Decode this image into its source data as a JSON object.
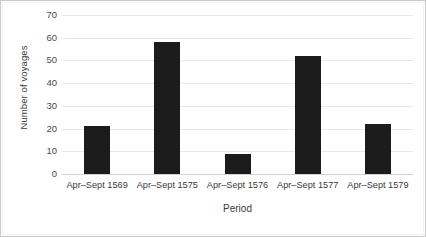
{
  "chart_data": {
    "type": "bar",
    "title": "",
    "xlabel": "Period",
    "ylabel": "Number of voyages",
    "categories": [
      "Apr–Sept 1569",
      "Apr–Sept 1575",
      "Apr–Sept 1576",
      "Apr–Sept 1577",
      "Apr–Sept 1579"
    ],
    "values": [
      21,
      58,
      9,
      52,
      22
    ],
    "ylim": [
      0,
      70
    ],
    "ytick_step": 10,
    "yticks": [
      70,
      60,
      50,
      40,
      30,
      20,
      10,
      0
    ],
    "ytick_labels": [
      "70",
      "60",
      "50",
      "40",
      "30",
      "20",
      "10",
      "0"
    ],
    "grid": true,
    "legend": false,
    "bar_color": "#1c1c1c",
    "gridline_color": "#e8e8e8",
    "background_color": "#ffffff",
    "border_color": "#c9c9c9"
  }
}
